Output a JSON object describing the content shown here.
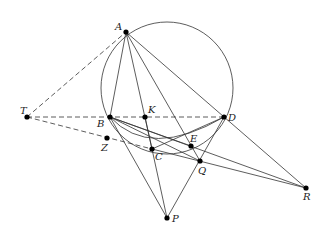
{
  "diagram": {
    "type": "geometry",
    "circle": {
      "cx": 167,
      "cy": 88,
      "r": 66
    },
    "points": [
      {
        "name": "A",
        "x": 126,
        "y": 32,
        "lx": 115,
        "ly": 30
      },
      {
        "name": "B",
        "x": 110,
        "y": 117,
        "lx": 97,
        "ly": 127
      },
      {
        "name": "K",
        "x": 145,
        "y": 117,
        "lx": 148,
        "ly": 113
      },
      {
        "name": "D",
        "x": 224,
        "y": 117,
        "lx": 228,
        "ly": 121
      },
      {
        "name": "T",
        "x": 27,
        "y": 117,
        "lx": 20,
        "ly": 114
      },
      {
        "name": "Z",
        "x": 107,
        "y": 138,
        "lx": 101,
        "ly": 151
      },
      {
        "name": "C",
        "x": 152,
        "y": 149,
        "lx": 155,
        "ly": 160
      },
      {
        "name": "E",
        "x": 191,
        "y": 146,
        "lx": 190,
        "ly": 142
      },
      {
        "name": "Q",
        "x": 200,
        "y": 161,
        "lx": 198,
        "ly": 174
      },
      {
        "name": "P",
        "x": 167,
        "y": 218,
        "lx": 172,
        "ly": 222
      },
      {
        "name": "R",
        "x": 306,
        "y": 188,
        "lx": 303,
        "ly": 200
      }
    ]
  }
}
